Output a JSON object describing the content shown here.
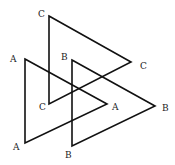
{
  "diagram": {
    "stroke_color": "#111111",
    "triangles": [
      {
        "name": "C",
        "points": "49,16 131,62 49,104",
        "labels": [
          {
            "text": "C",
            "x": 38,
            "y": 17
          },
          {
            "text": "C",
            "x": 140,
            "y": 69
          },
          {
            "text": "C",
            "x": 39,
            "y": 110
          }
        ]
      },
      {
        "name": "A",
        "points": "25,59 107,104 25,143",
        "labels": [
          {
            "text": "A",
            "x": 10,
            "y": 62
          },
          {
            "text": "A",
            "x": 112,
            "y": 110
          },
          {
            "text": "A",
            "x": 13,
            "y": 150
          }
        ]
      },
      {
        "name": "B",
        "points": "72,60 155,106 72,146",
        "labels": [
          {
            "text": "B",
            "x": 61,
            "y": 60
          },
          {
            "text": "B",
            "x": 162,
            "y": 111
          },
          {
            "text": "B",
            "x": 65,
            "y": 158
          }
        ]
      }
    ]
  }
}
